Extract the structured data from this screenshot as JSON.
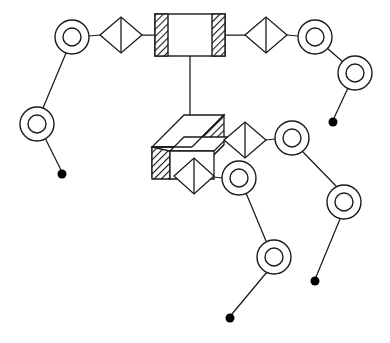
{
  "canvas": {
    "width": 390,
    "height": 343,
    "background": "#ffffff",
    "stroke_color": "#1a1a1a",
    "hatch_color": "#1a1a1a",
    "dot_fill": "#000000",
    "title": "Kinematic linkage schematic"
  },
  "legend_names": {
    "block_2d": "hatched-rectangle-block",
    "block_3d": "isometric-hatched-slab-block",
    "diamond": "diamond-joint-symbol",
    "ring": "double-ring-node",
    "dot": "terminal-dot",
    "link": "link-line"
  },
  "diagram": {
    "type": "schematic",
    "blocks": [
      {
        "id": "block-top-center",
        "name": "hatched-rectangle-block",
        "shape": "rectangle-with-hatched-side-bands",
        "x": 155,
        "y": 14,
        "width": 70,
        "height": 42,
        "hatch_band_width": 13,
        "hatch_sides": [
          "left",
          "right"
        ],
        "hatch_angle_deg": 45
      },
      {
        "id": "block-center-lower",
        "name": "isometric-hatched-slab-block",
        "shape": "isometric-slab-with-hatched-end-faces",
        "x": 152,
        "y": 115,
        "width": 72,
        "height": 78,
        "depth_dx": 32,
        "depth_dy": -32,
        "hatch_faces": [
          "right-end",
          "front-left-end"
        ],
        "hatch_angle_deg": 45
      }
    ],
    "diamonds": [
      {
        "id": "diamond-top-left",
        "name": "diamond-joint-symbol",
        "cx": 121,
        "cy": 35,
        "rx": 21,
        "ry": 18,
        "center_line": "vertical"
      },
      {
        "id": "diamond-top-right",
        "name": "diamond-joint-symbol",
        "cx": 266,
        "cy": 35,
        "rx": 21,
        "ry": 18,
        "center_line": "vertical"
      },
      {
        "id": "diamond-mid-right",
        "name": "diamond-joint-symbol",
        "cx": 245,
        "cy": 140,
        "rx": 21,
        "ry": 18,
        "center_line": "vertical"
      },
      {
        "id": "diamond-mid-lower",
        "name": "diamond-joint-symbol",
        "cx": 194,
        "cy": 176,
        "rx": 20,
        "ry": 18,
        "center_line": "vertical"
      }
    ],
    "rings": [
      {
        "id": "ring-tl-1",
        "name": "double-ring-node",
        "cx": 72,
        "cy": 37,
        "r_outer": 17,
        "r_inner": 9
      },
      {
        "id": "ring-tl-2",
        "name": "double-ring-node",
        "cx": 37,
        "cy": 124,
        "r_outer": 17,
        "r_inner": 9
      },
      {
        "id": "ring-tr-1",
        "name": "double-ring-node",
        "cx": 315,
        "cy": 37,
        "r_outer": 17,
        "r_inner": 9
      },
      {
        "id": "ring-tr-2",
        "name": "double-ring-node",
        "cx": 355,
        "cy": 73,
        "r_outer": 17,
        "r_inner": 9
      },
      {
        "id": "ring-mr-1",
        "name": "double-ring-node",
        "cx": 292,
        "cy": 138,
        "r_outer": 17,
        "r_inner": 9
      },
      {
        "id": "ring-mr-2",
        "name": "double-ring-node",
        "cx": 344,
        "cy": 202,
        "r_outer": 17,
        "r_inner": 9
      },
      {
        "id": "ring-ml-1",
        "name": "double-ring-node",
        "cx": 239,
        "cy": 178,
        "r_outer": 17,
        "r_inner": 9
      },
      {
        "id": "ring-bc-1",
        "name": "double-ring-node",
        "cx": 274,
        "cy": 257,
        "r_outer": 17,
        "r_inner": 9
      },
      {
        "id": "ring-extra",
        "name": "double-ring-node",
        "cx": 0,
        "cy": 0,
        "r_outer": 0,
        "r_inner": 0
      }
    ],
    "dots": [
      {
        "id": "dot-bl",
        "name": "terminal-dot",
        "cx": 62,
        "cy": 174,
        "r": 4.5
      },
      {
        "id": "dot-tr",
        "name": "terminal-dot",
        "cx": 333,
        "cy": 122,
        "r": 4.5
      },
      {
        "id": "dot-mr",
        "name": "terminal-dot",
        "cx": 315,
        "cy": 281,
        "r": 4.5
      },
      {
        "id": "dot-bc",
        "name": "terminal-dot",
        "cx": 230,
        "cy": 318,
        "r": 4.5
      },
      {
        "id": "dot-extra",
        "name": "terminal-dot",
        "cx": 0,
        "cy": 0,
        "r": 0
      }
    ],
    "links": [
      {
        "id": "link-ring-tl1-diamond-tl",
        "name": "link-line",
        "x1": 89,
        "y1": 36,
        "x2": 100,
        "y2": 35
      },
      {
        "id": "link-diamond-tl-block",
        "name": "link-line",
        "x1": 142,
        "y1": 35,
        "x2": 155,
        "y2": 35
      },
      {
        "id": "link-block-diamond-tr",
        "name": "link-line",
        "x1": 225,
        "y1": 35,
        "x2": 245,
        "y2": 35
      },
      {
        "id": "link-diamond-tr-ring-tr1",
        "name": "link-line",
        "x1": 287,
        "y1": 35,
        "x2": 298,
        "y2": 36
      },
      {
        "id": "link-ring-tl1-ring-tl2",
        "name": "link-line",
        "x1": 66,
        "y1": 53,
        "x2": 43,
        "y2": 108
      },
      {
        "id": "link-ring-tl2-dot-bl",
        "name": "link-line",
        "x1": 45,
        "y1": 138,
        "x2": 61,
        "y2": 170
      },
      {
        "id": "link-ring-tr1-ring-tr2",
        "name": "link-line",
        "x1": 327,
        "y1": 48,
        "x2": 343,
        "y2": 62
      },
      {
        "id": "link-ring-tr2-dot-tr",
        "name": "link-line",
        "x1": 348,
        "y1": 88,
        "x2": 334,
        "y2": 118
      },
      {
        "id": "link-block-vertical",
        "name": "link-line",
        "x1": 190,
        "y1": 56,
        "x2": 190,
        "y2": 122
      },
      {
        "id": "link-block3d-diamond-mr",
        "name": "link-line",
        "x1": 224,
        "y1": 140,
        "x2": 224,
        "y2": 140
      },
      {
        "id": "link-diamond-mr-ring-mr1",
        "name": "link-line",
        "x1": 266,
        "y1": 140,
        "x2": 275,
        "y2": 139
      },
      {
        "id": "link-ring-mr1-ring-mr2",
        "name": "link-line",
        "x1": 303,
        "y1": 152,
        "x2": 336,
        "y2": 186
      },
      {
        "id": "link-ring-mr2-dot-mr",
        "name": "link-line",
        "x1": 340,
        "y1": 219,
        "x2": 316,
        "y2": 277
      },
      {
        "id": "link-diamond-ml-ring-ml1",
        "name": "link-line",
        "x1": 214,
        "y1": 177,
        "x2": 222,
        "y2": 178
      },
      {
        "id": "link-ring-ml1-ring-bc1",
        "name": "link-line",
        "x1": 246,
        "y1": 193,
        "x2": 266,
        "y2": 241
      },
      {
        "id": "link-ring-bc1-dot-bc",
        "name": "link-line",
        "x1": 267,
        "y1": 272,
        "x2": 232,
        "y2": 314
      }
    ]
  },
  "counts": {
    "rings": 8,
    "diamonds": 4,
    "blocks": 2,
    "dots": 4
  }
}
